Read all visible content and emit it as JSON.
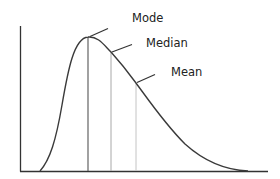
{
  "diagram": {
    "title": "",
    "type": "right-skewed-distribution",
    "labels": {
      "mode": "Mode",
      "median": "Median",
      "mean": "Mean"
    },
    "colors": {
      "axis": "#333333",
      "curve": "#3a3a3a",
      "mode_line": "#555555",
      "median_line": "#a8a8a8",
      "mean_line": "#c4c4c4",
      "label_text": "#222222",
      "background": "#ffffff"
    },
    "markers": [
      {
        "name": "Mode",
        "x": 88,
        "y": 37
      },
      {
        "name": "Median",
        "x": 111,
        "y": 52
      },
      {
        "name": "Mean",
        "x": 136,
        "y": 83
      }
    ]
  }
}
